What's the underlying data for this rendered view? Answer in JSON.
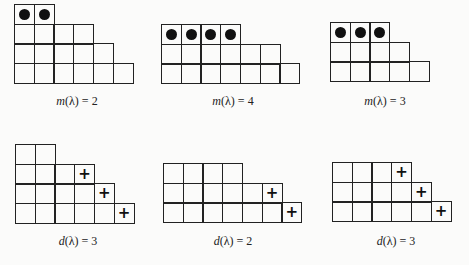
{
  "cell_size": 21,
  "diagrams": [
    {
      "id": "m1",
      "left": 14,
      "top": 4,
      "rows": [
        {
          "length": 2,
          "marks": [
            "dot",
            "dot"
          ]
        },
        {
          "length": 4,
          "marks": []
        },
        {
          "length": 5,
          "marks": []
        },
        {
          "length": 6,
          "marks": []
        }
      ],
      "caption": {
        "func": "m",
        "arg": "λ",
        "value": "2",
        "x": 77,
        "y": 94
      }
    },
    {
      "id": "m2",
      "left": 161,
      "top": 24,
      "rows": [
        {
          "length": 4,
          "marks": [
            "dot",
            "dot",
            "dot",
            "dot"
          ]
        },
        {
          "length": 6,
          "marks": []
        },
        {
          "length": 7,
          "marks": []
        }
      ],
      "caption": {
        "func": "m",
        "arg": "λ",
        "value": "4",
        "x": 233,
        "y": 94
      }
    },
    {
      "id": "m3",
      "left": 330,
      "top": 22,
      "rows": [
        {
          "length": 3,
          "marks": [
            "dot",
            "dot",
            "dot"
          ]
        },
        {
          "length": 4,
          "marks": []
        },
        {
          "length": 5,
          "marks": []
        }
      ],
      "caption": {
        "func": "m",
        "arg": "λ",
        "value": "3",
        "x": 385,
        "y": 94
      }
    },
    {
      "id": "d1",
      "left": 15,
      "top": 144,
      "rows": [
        {
          "length": 2,
          "marks": []
        },
        {
          "length": 4,
          "marks": [
            "",
            "",
            "",
            "plus"
          ]
        },
        {
          "length": 5,
          "marks": [
            "",
            "",
            "",
            "",
            "plus"
          ]
        },
        {
          "length": 6,
          "marks": [
            "",
            "",
            "",
            "",
            "",
            "plus"
          ]
        }
      ],
      "caption": {
        "func": "d",
        "arg": "λ",
        "value": "3",
        "x": 78,
        "y": 234
      }
    },
    {
      "id": "d2",
      "left": 163,
      "top": 163,
      "rows": [
        {
          "length": 4,
          "marks": []
        },
        {
          "length": 6,
          "marks": [
            "",
            "",
            "",
            "",
            "",
            "plus"
          ]
        },
        {
          "length": 7,
          "marks": [
            "",
            "",
            "",
            "",
            "",
            "",
            "plus"
          ]
        }
      ],
      "caption": {
        "func": "d",
        "arg": "λ",
        "value": "2",
        "x": 233,
        "y": 234
      }
    },
    {
      "id": "d3",
      "left": 332,
      "top": 162,
      "rows": [
        {
          "length": 4,
          "marks": [
            "",
            "",
            "",
            "plus"
          ]
        },
        {
          "length": 5,
          "marks": [
            "",
            "",
            "",
            "",
            "plus"
          ]
        },
        {
          "length": 6,
          "marks": [
            "",
            "",
            "",
            "",
            "",
            "plus"
          ]
        }
      ],
      "caption": {
        "func": "d",
        "arg": "λ",
        "value": "3",
        "x": 396,
        "y": 234
      }
    }
  ],
  "symbols": {
    "dot": "●",
    "plus": "+"
  },
  "labels": {
    "m1": "m(λ) = 2",
    "m2": "m(λ) = 4",
    "m3": "m(λ) = 3",
    "d1": "d(λ) = 3",
    "d2": "d(λ) = 2",
    "d3": "d(λ) = 3"
  }
}
